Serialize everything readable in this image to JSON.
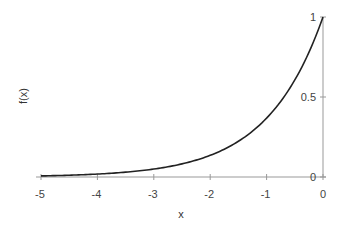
{
  "chart_data": {
    "type": "line",
    "title": "",
    "xlabel": "x",
    "ylabel": "f(x)",
    "xlim": [
      -5,
      0
    ],
    "ylim": [
      0,
      1
    ],
    "grid": false,
    "legend": null,
    "x_ticks": [
      -5,
      -4,
      -3,
      -2,
      -1,
      0
    ],
    "x_tick_labels": [
      "-5",
      "-4",
      "-3",
      "-2",
      "-1",
      "0"
    ],
    "y_ticks": [
      0,
      0.5,
      1
    ],
    "y_tick_labels": [
      "0",
      "0.5",
      "1"
    ],
    "y_axis_position": "right (at x=0)",
    "series": [
      {
        "name": "f(x)",
        "function": "exp(x)",
        "color": "#222222",
        "x": [
          -5,
          -4.5,
          -4,
          -3.5,
          -3,
          -2.5,
          -2,
          -1.5,
          -1,
          -0.5,
          0
        ],
        "y": [
          0.007,
          0.011,
          0.018,
          0.03,
          0.05,
          0.082,
          0.135,
          0.223,
          0.368,
          0.607,
          1.0
        ]
      }
    ]
  },
  "colors": {
    "curve": "#222222",
    "axis": "#999999",
    "text": "#444444"
  }
}
